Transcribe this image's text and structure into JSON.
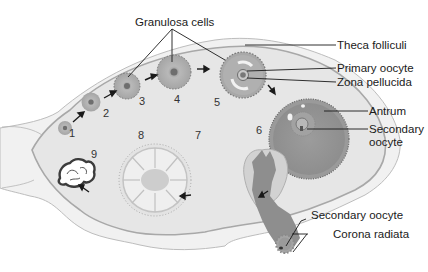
{
  "diagram": {
    "type": "anatomical illustration",
    "colors": {
      "background": "#ffffff",
      "ovary_stroma": "#e8e8e8",
      "ovary_outer": "#f1f1f1",
      "cortex_line": "#a9a9a9",
      "follicle_gray": "#9a9a9a",
      "dark_gray": "#7a7a7a",
      "text": "#1a1a1a"
    }
  },
  "labels": {
    "granulosa_cells": "Granulosa cells",
    "theca_folliculi": "Theca folliculi",
    "primary_oocyte": "Primary oocyte",
    "zona_pellucida": "Zona pellucida",
    "antrum": "Antrum",
    "secondary_oocyte_l1": "Secondary",
    "secondary_oocyte_l2": "oocyte",
    "ovulated_secondary_oocyte": "Secondary oocyte",
    "corona_radiata": "Corona radiata"
  },
  "stages": [
    {
      "number": "1"
    },
    {
      "number": "2"
    },
    {
      "number": "3"
    },
    {
      "number": "4"
    },
    {
      "number": "5"
    },
    {
      "number": "6"
    },
    {
      "number": "7"
    },
    {
      "number": "8"
    },
    {
      "number": "9"
    }
  ]
}
